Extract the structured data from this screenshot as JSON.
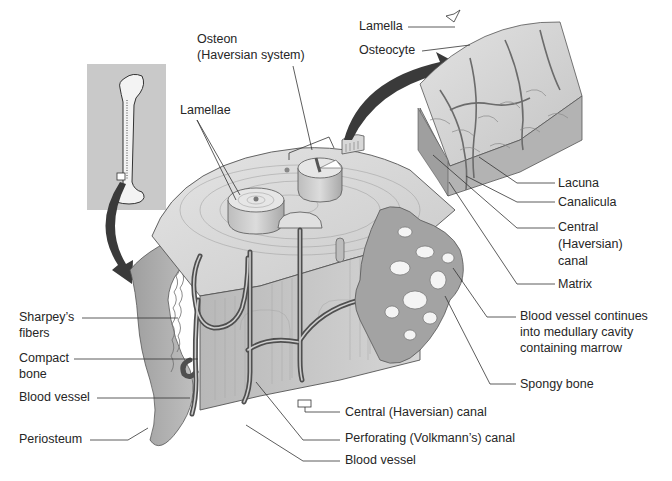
{
  "diagram": {
    "colors": {
      "background": "#ffffff",
      "bone_light": "#d9d9d9",
      "bone_mid": "#bdbdbd",
      "bone_dark": "#8f8f8f",
      "vessel": "#5a5a5a",
      "inset_bg": "#c8c8c8",
      "arrow": "#3a3a3a",
      "leader": "#333333"
    },
    "labels": {
      "osteon": "Osteon",
      "osteon_sub": "(Haversian system)",
      "lamellae": "Lamellae",
      "lamella": "Lamella",
      "osteocyte": "Osteocyte",
      "lacuna": "Lacuna",
      "canalicula": "Canalicula",
      "central_canal_1": "Central",
      "central_canal_2": "(Haversian)",
      "central_canal_3": "canal",
      "matrix": "Matrix",
      "blood_vessel_continues_1": "Blood vessel continues",
      "blood_vessel_continues_2": "into medullary cavity",
      "blood_vessel_continues_3": "containing marrow",
      "spongy_bone": "Spongy bone",
      "sharpeys_1": "Sharpey’s",
      "sharpeys_2": "fibers",
      "compact_1": "Compact",
      "compact_2": "bone",
      "blood_vessel_left": "Blood vessel",
      "periosteum": "Periosteum",
      "central_haversian_canal": "Central (Haversian) canal",
      "perforating_canal": "Perforating (Volkmann’s) canal",
      "blood_vessel_bottom": "Blood vessel"
    }
  }
}
